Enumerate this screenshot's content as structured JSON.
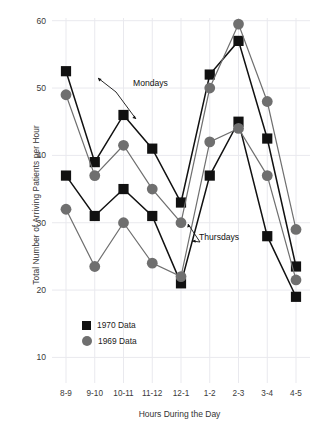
{
  "chart_data": {
    "type": "line",
    "title": "",
    "subtitle": "",
    "xlabel": "Hours During the Day",
    "ylabel": "Total Number of Arriving Patients per Hour",
    "categories": [
      "8-9",
      "9-10",
      "10-11",
      "11-12",
      "12-1",
      "1-2",
      "2-3",
      "3-4",
      "4-5"
    ],
    "ylim": [
      0,
      60
    ],
    "yticks": [
      10,
      20,
      30,
      40,
      50,
      60
    ],
    "xlim_categories": 9,
    "grid": "light vertical and horizontal gridlines",
    "legend_position": "inside lower-left",
    "series": [
      {
        "name": "Mondays 1970 Data",
        "day": "Mondays",
        "year": "1970",
        "marker": "square",
        "color": "#111111",
        "values": [
          52.5,
          39,
          46,
          41,
          33,
          52,
          57,
          42.5,
          23.5
        ]
      },
      {
        "name": "Mondays 1969 Data",
        "day": "Mondays",
        "year": "1969",
        "marker": "circle",
        "color": "#6f6f6f",
        "values": [
          49,
          37,
          41.5,
          35,
          30,
          50,
          59.5,
          48,
          29
        ]
      },
      {
        "name": "Thursdays 1970 Data",
        "day": "Thursdays",
        "year": "1970",
        "marker": "square",
        "color": "#111111",
        "values": [
          37,
          31,
          35,
          31,
          21,
          37,
          45,
          28,
          19
        ]
      },
      {
        "name": "Thursdays 1969 Data",
        "day": "Thursdays",
        "year": "1969",
        "marker": "circle",
        "color": "#6f6f6f",
        "values": [
          32,
          23.5,
          30,
          24,
          22,
          42,
          44,
          37,
          21.5
        ]
      }
    ],
    "annotations": [
      {
        "id": "mondays",
        "text": "Mondays"
      },
      {
        "id": "thursdays",
        "text": "Thursdays"
      }
    ]
  },
  "legend": {
    "items": [
      {
        "label": "1970 Data",
        "marker": "square",
        "color": "#111111"
      },
      {
        "label": "1969 Data",
        "marker": "circle",
        "color": "#6f6f6f"
      }
    ]
  },
  "axes": {
    "y_title": "Total Number of Arriving Patients per Hour",
    "x_title": "Hours During the Day",
    "y_tick_labels": [
      "60",
      "50",
      "40",
      "30",
      "20",
      "10"
    ],
    "x_tick_labels": [
      "8-9",
      "9-10",
      "10-11",
      "11-12",
      "12-1",
      "1-2",
      "2-3",
      "3-4",
      "4-5"
    ]
  },
  "annotations": {
    "mondays": "Mondays",
    "thursdays": "Thursdays"
  },
  "colors": {
    "square_series": "#111111",
    "circle_series": "#6f6f6f",
    "grid": "#e9e9ee",
    "text": "#333333"
  }
}
